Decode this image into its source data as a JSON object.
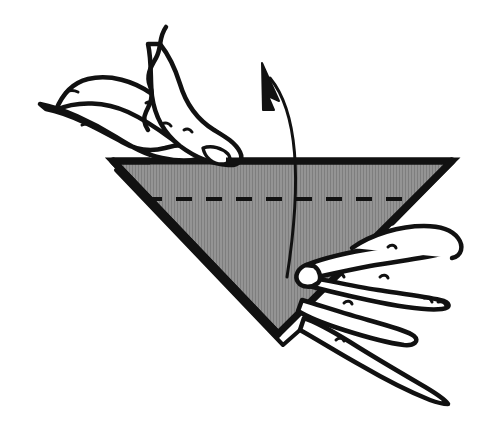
{
  "figure": {
    "kind": "origami-fold-instruction-diagram",
    "title": "Origami fold step: two hands holding a shaded downward-pointing triangle while the front flap is lifted upward",
    "canvas": {
      "width": 482,
      "height": 428,
      "background": "#ffffff"
    },
    "style": {
      "ink_color": "#111111",
      "paper_fill": "#8a8a8a",
      "paper_fill_light": "#949494",
      "hand_fill": "#ffffff",
      "halftone_line": "#7e7e7e",
      "outline_width_main": 7,
      "outline_width_thin": 3,
      "hand_stroke_width": 4
    },
    "shapes": {
      "paper_triangle": {
        "name": "shaded triangle flap",
        "fill": "#8a8a8a",
        "stroke": "#111111",
        "vertices": [
          {
            "label": "top-left",
            "x": 113,
            "y": 161
          },
          {
            "label": "top-right",
            "x": 452,
            "y": 161
          },
          {
            "label": "bottom",
            "x": 278,
            "y": 334
          }
        ]
      },
      "hidden_layer_edge": {
        "name": "second layer behind triangle (offset thin outline)",
        "stroke": "#111111",
        "points": [
          {
            "x": 116,
            "y": 170
          },
          {
            "x": 283,
            "y": 345
          },
          {
            "x": 300,
            "y": 330
          }
        ]
      },
      "crease_dashes": {
        "name": "horizontal dashed crease line",
        "y": 199,
        "x_start": 146,
        "x_end": 427,
        "dash_pattern": "16 14",
        "stroke": "#111111",
        "stroke_width": 4
      },
      "motion_arrow": {
        "name": "curved upward motion arrow",
        "stroke": "#111111",
        "stroke_width": 3,
        "tail": {
          "x": 287,
          "y": 277
        },
        "tip": {
          "x": 263,
          "y": 66
        },
        "control_points": [
          {
            "x": 299,
            "y": 200
          },
          {
            "x": 303,
            "y": 118
          }
        ],
        "arrowhead": "solid-triangle-up-left"
      },
      "left_hand": {
        "name": "left hand pressing the top edge of the triangle",
        "digits": [
          "index finger pointing left and resting on top edge",
          "second finger overlapping above it",
          "wavy contour of hand running off top of frame"
        ]
      },
      "right_hand": {
        "name": "right hand fingers curled under the lower right edge",
        "digits": [
          "thumb tip against the lower edge",
          "index finger",
          "middle finger",
          "ring finger extending to lower right"
        ]
      }
    },
    "labels": {
      "step_caption": "",
      "step_number": ""
    }
  }
}
